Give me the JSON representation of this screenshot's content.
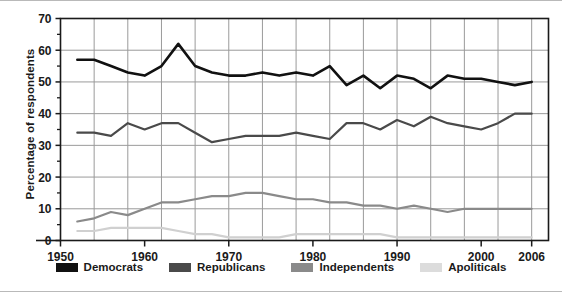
{
  "chart_data": {
    "type": "line",
    "title": "",
    "xlabel": "",
    "ylabel": "Percentage of respondents",
    "xlim": [
      1950,
      2008
    ],
    "ylim": [
      0,
      70
    ],
    "yticks": [
      0,
      10,
      20,
      30,
      40,
      50,
      60,
      70
    ],
    "yminor_step": 5,
    "xticks": [
      1950,
      1960,
      1970,
      1980,
      1990,
      2000,
      2006
    ],
    "xtick_labels": [
      "1950",
      "1960",
      "1970",
      "1980",
      "1990",
      "2000",
      "2006"
    ],
    "xgrid_step": 4,
    "grid": true,
    "legend_position": "bottom",
    "x": [
      1952,
      1954,
      1956,
      1958,
      1960,
      1962,
      1964,
      1966,
      1968,
      1970,
      1972,
      1974,
      1976,
      1978,
      1980,
      1982,
      1984,
      1986,
      1988,
      1990,
      1992,
      1994,
      1996,
      1998,
      2000,
      2002,
      2004,
      2006
    ],
    "series": [
      {
        "name": "Democrats",
        "color": "#111111",
        "width": 2.6,
        "values": [
          57,
          57,
          55,
          53,
          52,
          55,
          62,
          55,
          53,
          52,
          52,
          53,
          52,
          53,
          52,
          55,
          49,
          52,
          48,
          52,
          51,
          48,
          52,
          51,
          51,
          50,
          49,
          50
        ]
      },
      {
        "name": "Republicans",
        "color": "#4a4a4a",
        "width": 2.2,
        "values": [
          34,
          34,
          33,
          37,
          35,
          37,
          37,
          34,
          31,
          32,
          33,
          33,
          33,
          34,
          33,
          32,
          37,
          37,
          35,
          38,
          36,
          39,
          37,
          36,
          35,
          37,
          40,
          40
        ]
      },
      {
        "name": "Independents",
        "color": "#8a8a8a",
        "width": 2.2,
        "values": [
          6,
          7,
          9,
          8,
          10,
          12,
          12,
          13,
          14,
          14,
          15,
          15,
          14,
          13,
          13,
          12,
          12,
          11,
          11,
          10,
          11,
          10,
          9,
          10,
          10,
          10,
          10,
          10
        ]
      },
      {
        "name": "Apoliticals",
        "color": "#d0d0d0",
        "width": 2.2,
        "values": [
          3,
          3,
          4,
          4,
          4,
          4,
          3,
          2,
          2,
          1,
          1,
          1,
          1,
          2,
          2,
          2,
          2,
          2,
          2,
          1,
          1,
          1,
          1,
          1,
          1,
          1,
          1,
          1
        ]
      }
    ]
  },
  "legend": {
    "items": [
      {
        "label": "Democrats",
        "color": "#111111"
      },
      {
        "label": "Republicans",
        "color": "#4a4a4a"
      },
      {
        "label": "Independents",
        "color": "#8a8a8a"
      },
      {
        "label": "Apoliticals",
        "color": "#dcdcdc"
      }
    ]
  },
  "axes": {
    "y_title": "Percentage of respondents"
  }
}
